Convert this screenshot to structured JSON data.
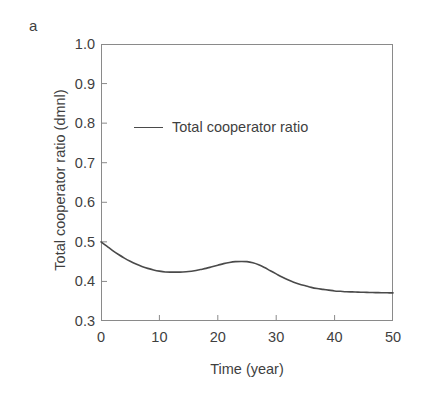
{
  "figure": {
    "panel_label": "a",
    "background_color": "#ffffff",
    "axis_color": "#8a8a8a",
    "text_color": "#3f3f3f"
  },
  "chart_data": {
    "type": "line",
    "title": "",
    "subtitle": "",
    "xlabel": "Time (year)",
    "ylabel": "Total cooperator ratio (dmnl)",
    "xlim": [
      0,
      50
    ],
    "ylim": [
      0.3,
      1.0
    ],
    "xticks": [
      0,
      10,
      20,
      30,
      40,
      50
    ],
    "yticks": [
      0.3,
      0.4,
      0.5,
      0.6,
      0.7,
      0.8,
      0.9,
      1.0
    ],
    "xtick_labels": [
      "0",
      "10",
      "20",
      "30",
      "40",
      "50"
    ],
    "ytick_labels": [
      "0.3",
      "0.4",
      "0.5",
      "0.6",
      "0.7",
      "0.8",
      "0.9",
      "1.0"
    ],
    "grid": false,
    "legend_position": "upper-left-inside",
    "series": [
      {
        "name": "Total cooperator ratio",
        "color": "#4a4a4a",
        "line_width": 1.6,
        "x": [
          0,
          1,
          2,
          3,
          4,
          5,
          6,
          7,
          8,
          9,
          10,
          11,
          12,
          13,
          14,
          15,
          16,
          17,
          18,
          19,
          20,
          21,
          22,
          23,
          24,
          25,
          26,
          27,
          28,
          29,
          30,
          31,
          32,
          33,
          34,
          35,
          36,
          37,
          38,
          39,
          40,
          41,
          42,
          43,
          44,
          45,
          46,
          47,
          48,
          49,
          50
        ],
        "values": [
          0.5,
          0.489,
          0.478,
          0.468,
          0.459,
          0.451,
          0.444,
          0.438,
          0.433,
          0.429,
          0.426,
          0.424,
          0.4235,
          0.4235,
          0.424,
          0.425,
          0.427,
          0.43,
          0.433,
          0.437,
          0.441,
          0.445,
          0.448,
          0.45,
          0.4505,
          0.45,
          0.447,
          0.442,
          0.435,
          0.427,
          0.419,
          0.411,
          0.404,
          0.398,
          0.393,
          0.389,
          0.385,
          0.382,
          0.38,
          0.378,
          0.376,
          0.375,
          0.374,
          0.3735,
          0.373,
          0.3725,
          0.372,
          0.3718,
          0.3715,
          0.3713,
          0.371
        ]
      }
    ]
  },
  "legend": {
    "entries": [
      {
        "label": "Total cooperator ratio",
        "color": "#4a4a4a"
      }
    ]
  }
}
